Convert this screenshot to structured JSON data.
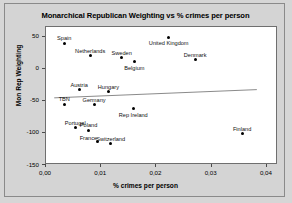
{
  "chart_data": {
    "type": "scatter",
    "title": "Monarchical Republican Weighting vs % crimes per person",
    "xlabel": "% crimes per person",
    "ylabel": "Mon Rep Weighting",
    "xlim": [
      0.0,
      0.042
    ],
    "ylim": [
      -150,
      65
    ],
    "xticks": [
      "0,00",
      "0,01",
      "0,02",
      "0,03",
      "0,04"
    ],
    "xtick_values": [
      0.0,
      0.01,
      0.02,
      0.03,
      0.04
    ],
    "yticks": [
      "50",
      "0",
      "-50",
      "-100",
      "-150"
    ],
    "ytick_values": [
      50,
      0,
      -50,
      -100,
      -150
    ],
    "grid": false,
    "legend": "none",
    "point_color": "#000000",
    "trendline": {
      "label": "linear trend",
      "color": "#6b6b6b",
      "x_start": 0.0015,
      "y_start": -47,
      "x_end": 0.0385,
      "y_end": -34
    },
    "points": [
      {
        "label": "Spain",
        "x": 0.0033,
        "y": 40,
        "label_pos": "above"
      },
      {
        "label": "Netherlands",
        "x": 0.008,
        "y": 20,
        "label_pos": "above"
      },
      {
        "label": "Sweden",
        "x": 0.0137,
        "y": 17,
        "label_pos": "above"
      },
      {
        "label": "Belgium",
        "x": 0.016,
        "y": 11,
        "label_pos": "below"
      },
      {
        "label": "United Kingdom",
        "x": 0.0222,
        "y": 49,
        "label_pos": "below"
      },
      {
        "label": "Denmark",
        "x": 0.027,
        "y": 14,
        "label_pos": "above"
      },
      {
        "label": "Austria",
        "x": 0.006,
        "y": -33,
        "label_pos": "above"
      },
      {
        "label": "Hungary",
        "x": 0.0113,
        "y": -36,
        "label_pos": "above"
      },
      {
        "label": "TBN",
        "x": 0.0033,
        "y": -55,
        "label_pos": "above"
      },
      {
        "label": "Germany",
        "x": 0.0087,
        "y": -56,
        "label_pos": "above"
      },
      {
        "label": "Rep Ireland",
        "x": 0.0158,
        "y": -62,
        "label_pos": "below"
      },
      {
        "label": "Portugal",
        "x": 0.0053,
        "y": -92,
        "label_pos": "above"
      },
      {
        "label": "Poland",
        "x": 0.0077,
        "y": -96,
        "label_pos": "above"
      },
      {
        "label": "France",
        "x": 0.0093,
        "y": -113,
        "label_pos": "left"
      },
      {
        "label": "Switzerland",
        "x": 0.0117,
        "y": -117,
        "label_pos": "above"
      },
      {
        "label": "Finland",
        "x": 0.0355,
        "y": -101,
        "label_pos": "above"
      }
    ]
  }
}
